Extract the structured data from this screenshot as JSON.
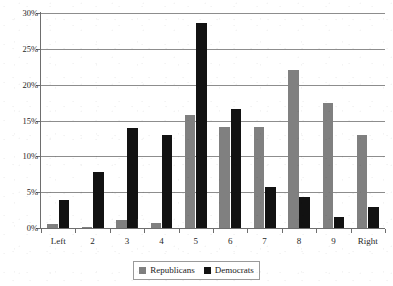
{
  "chart_data": {
    "type": "bar",
    "title": "",
    "subtitle": "",
    "xlabel": "",
    "ylabel": "",
    "categories": [
      "Left",
      "2",
      "3",
      "4",
      "5",
      "6",
      "7",
      "8",
      "9",
      "Right"
    ],
    "series": [
      {
        "name": "Republicans",
        "color": "#808080",
        "values": [
          0.5,
          0.1,
          1.1,
          0.7,
          15.8,
          14.1,
          14.1,
          22.0,
          17.5,
          13.0
        ]
      },
      {
        "name": "Democrats",
        "color": "#121212",
        "values": [
          3.9,
          7.8,
          14.0,
          13.0,
          28.6,
          16.6,
          5.7,
          4.3,
          1.6,
          2.9
        ]
      }
    ],
    "ylim": [
      0,
      30
    ],
    "ytick_values": [
      0,
      5,
      10,
      15,
      20,
      25,
      30
    ],
    "ytick_labels": [
      "0%",
      "5%",
      "10%",
      "15%",
      "20%",
      "25%",
      "30%"
    ],
    "grid": "horizontal",
    "legend_position": "bottom",
    "value_unit": "%",
    "annotations": []
  },
  "legend": {
    "entries": [
      {
        "label": "Republicans",
        "color": "#808080"
      },
      {
        "label": "Democrats",
        "color": "#121212"
      }
    ]
  },
  "page": {
    "top_fragment_left": "",
    "top_fragment_mid": "",
    "top_fragment_right": ""
  }
}
